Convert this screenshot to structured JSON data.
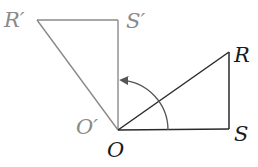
{
  "diagram": {
    "colors": {
      "original": "#2a2a2a",
      "image": "#8a8a8a",
      "background": "#ffffff"
    },
    "labels": {
      "R_prime": "R′",
      "S_prime": "S′",
      "O_prime": "O′",
      "O": "O",
      "R": "R",
      "S": "S"
    },
    "points": {
      "O": [
        118,
        130
      ],
      "R": [
        229,
        52
      ],
      "S": [
        229,
        129
      ],
      "R_prime": [
        37,
        20
      ],
      "S_prime": [
        118,
        20
      ],
      "O_prime": [
        118,
        130
      ]
    },
    "rotation_arrow": {
      "center": [
        118,
        130
      ],
      "radius": 50,
      "from_deg": 0,
      "to_deg": 90,
      "direction": "counterclockwise"
    }
  }
}
